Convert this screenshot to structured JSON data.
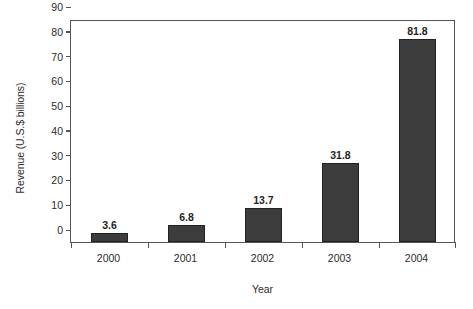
{
  "chart_data": {
    "type": "bar",
    "title": "",
    "subtitle": "",
    "xlabel": "Year",
    "ylabel": "Revenue (U.S.$ billions)",
    "categories": [
      "2000",
      "2001",
      "2002",
      "2003",
      "2004"
    ],
    "values": [
      3.6,
      6.8,
      13.7,
      31.8,
      81.8
    ],
    "value_labels": [
      "3.6",
      "6.8",
      "13.7",
      "31.8",
      "81.8"
    ],
    "ylim": [
      0,
      90
    ],
    "ytick_labels": [
      "0",
      "10",
      "20",
      "30",
      "40",
      "50",
      "60",
      "70",
      "80",
      "90"
    ],
    "ytick_values": [
      0,
      10,
      20,
      30,
      40,
      50,
      60,
      70,
      80,
      90
    ],
    "grid": false,
    "legend": null,
    "legend_position": "none",
    "bar_color": "#3c3c3c",
    "bar_edge_color": "#222222",
    "axis_color": "#555555",
    "text_color": "#2b2b2b",
    "background_color": "#ffffff"
  }
}
